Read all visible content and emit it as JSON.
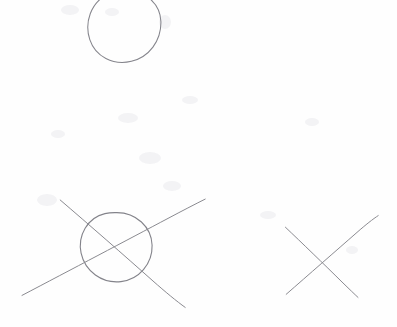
{
  "canvas": {
    "width": 397,
    "height": 327,
    "background_color": "#fefefe",
    "description": "Hand-drawn pencil sketch on white paper showing three geometric figures"
  },
  "style": {
    "stroke_color": "#8a8a90",
    "stroke_color_dark": "#7c7c84",
    "stroke_width": 1.0,
    "smudge_color": "#f3f3f5"
  },
  "chart_data": {
    "type": "diagram",
    "title": "",
    "figures": [
      {
        "name": "top-circle",
        "shape": "circle",
        "center_x": 124,
        "center_y": 26,
        "radius_x": 36,
        "radius_y": 36,
        "label": "Circle"
      },
      {
        "name": "circle-with-cross",
        "shape": "circle-with-x",
        "center_x": 116,
        "center_y": 247,
        "radius_x": 36,
        "radius_y": 35,
        "label": "Circle crossed by two lines",
        "lines": [
          {
            "name": "ascending-line",
            "x1": 22,
            "y1": 295,
            "x2": 205,
            "y2": 199
          },
          {
            "name": "descending-line",
            "x1": 60,
            "y1": 200,
            "x2": 185,
            "y2": 307
          }
        ]
      },
      {
        "name": "right-cross",
        "shape": "x-cross",
        "center_x": 331,
        "center_y": 256,
        "label": "X cross mark",
        "lines": [
          {
            "name": "ascending-line",
            "x1": 286,
            "y1": 294,
            "x2": 378,
            "y2": 216
          },
          {
            "name": "descending-line",
            "x1": 285,
            "y1": 227,
            "x2": 358,
            "y2": 297
          }
        ]
      }
    ],
    "figure_count": 3,
    "xlabel": "",
    "ylabel": "",
    "legend": [],
    "grid": false,
    "annotations": []
  }
}
